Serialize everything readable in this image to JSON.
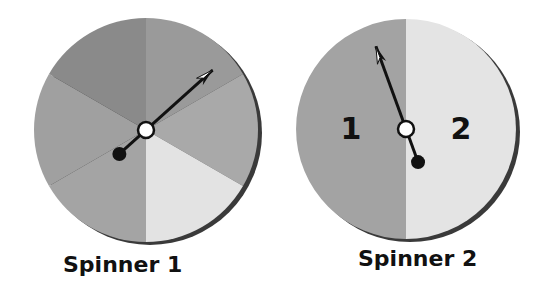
{
  "spinners": [
    {
      "label": "Spinner 1",
      "center": [
        146,
        130
      ],
      "radius": 112,
      "sectors": [
        {
          "start": 0,
          "end": 60,
          "color": "#9a9a9a"
        },
        {
          "start": 60,
          "end": 120,
          "color": "#a9a9a9"
        },
        {
          "start": 120,
          "end": 180,
          "color": "#e3e3e3"
        },
        {
          "start": 180,
          "end": 240,
          "color": "#a4a4a4"
        },
        {
          "start": 240,
          "end": 300,
          "color": "#a0a0a0"
        },
        {
          "start": 300,
          "end": 360,
          "color": "#8a8a8a"
        }
      ],
      "arrow_angle": 48
    },
    {
      "label": "Spinner 2",
      "center": [
        406,
        129
      ],
      "radius": 110,
      "sectors": [
        {
          "start": 0,
          "end": 180,
          "color": "#e4e4e4",
          "label": "2"
        },
        {
          "start": 180,
          "end": 360,
          "color": "#a3a3a3",
          "label": "1"
        }
      ],
      "arrow_angle": -20
    }
  ]
}
